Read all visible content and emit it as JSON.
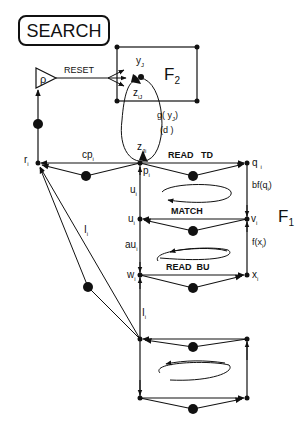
{
  "title": "SEARCH",
  "fields": {
    "f2": {
      "label": "F",
      "sub": "2"
    },
    "f1": {
      "label": "F",
      "sub": "1"
    }
  },
  "reset": {
    "label": "RESET",
    "vigilance": "ρ"
  },
  "f2_labels": {
    "yJ": {
      "base": "y",
      "sub": "J"
    },
    "ziJ": {
      "base": "z",
      "sub": "iJ"
    },
    "zJi": {
      "base": "z",
      "sub": "Ji"
    },
    "g": "g( y",
    "g_sub": "J",
    "g_close": ")",
    "d": "(d )"
  },
  "nodes": {
    "r": {
      "base": "r",
      "sub": "i"
    },
    "p": {
      "base": "p",
      "sub": "i"
    },
    "q": {
      "base": "q",
      "sub": "i"
    },
    "u_top": {
      "base": "u",
      "sub": "i"
    },
    "u": {
      "base": "u",
      "sub": "i"
    },
    "v": {
      "base": "v",
      "sub": "i"
    },
    "w": {
      "base": "w",
      "sub": "i"
    },
    "x": {
      "base": "x",
      "sub": "i"
    },
    "au": {
      "base": "au",
      "sub": "i"
    },
    "cp": {
      "base": "cp",
      "sub": "i"
    },
    "I_upper": {
      "base": "I",
      "sub": "i"
    },
    "I_lower": {
      "base": "I",
      "sub": "i"
    }
  },
  "stage_labels": {
    "read_td": "READ   TD",
    "match": "MATCH",
    "read_bu": "READ  BU"
  },
  "signal_labels": {
    "bf": "bf(q",
    "bf_sub": "i",
    "bf_close": ")",
    "f": "f(x",
    "f_sub": "i",
    "f_close": ")"
  },
  "colors": {
    "ink": "#111111",
    "background": "#ffffff"
  }
}
